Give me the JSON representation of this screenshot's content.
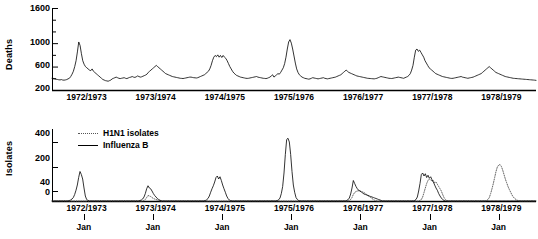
{
  "figure": {
    "panels": [
      {
        "id": "deaths",
        "ylabel": "Deaths",
        "yticks": [
          200,
          600,
          1000,
          1600
        ],
        "ymin": 200,
        "ymax": 1600
      },
      {
        "id": "isolates",
        "ylabel": "Isolates",
        "yticks": [
          0,
          40,
          200,
          400
        ],
        "ymin": 0,
        "ymax": 440
      }
    ],
    "seasons": [
      "1972/1973",
      "1973/1974",
      "1974/1975",
      "1975/1976",
      "1976/1977",
      "1977/1978",
      "1978/1979"
    ],
    "jan_label": "Jan",
    "legend": [
      {
        "label": "H1N1 isolates",
        "style": "dotted",
        "color": "#555555"
      },
      {
        "label": "Influenza B",
        "style": "solid",
        "color": "#000000"
      }
    ]
  },
  "chart_data": [
    {
      "type": "line",
      "id": "weekly-deaths",
      "title": "",
      "xlabel": "",
      "ylabel": "Deaths",
      "ylim": [
        200,
        1600
      ],
      "yticks": [
        200,
        600,
        1000,
        1600
      ],
      "grid": false,
      "legend_position": "none",
      "x_season_labels": [
        "1972/1973",
        "1973/1974",
        "1974/1975",
        "1975/1976",
        "1976/1977",
        "1977/1978",
        "1978/1979"
      ],
      "x_units": "weeks (7 seasons, 52 weeks each)",
      "series": [
        {
          "name": "Deaths",
          "color": "#000000",
          "values": [
            400,
            398,
            392,
            385,
            380,
            375,
            372,
            378,
            370,
            368,
            372,
            378,
            390,
            400,
            430,
            470,
            520,
            600,
            700,
            850,
            1020,
            960,
            820,
            700,
            640,
            600,
            580,
            560,
            540,
            530,
            560,
            520,
            500,
            480,
            460,
            440,
            420,
            400,
            380,
            370,
            360,
            355,
            350,
            360,
            370,
            390,
            400,
            410,
            420,
            410,
            400,
            395,
            400,
            405,
            410,
            400,
            395,
            405,
            415,
            420,
            430,
            420,
            415,
            425,
            440,
            430,
            420,
            425,
            435,
            445,
            455,
            470,
            500,
            520,
            540,
            560,
            580,
            600,
            620,
            600,
            580,
            560,
            540,
            520,
            500,
            480,
            470,
            460,
            450,
            440,
            430,
            425,
            420,
            415,
            410,
            405,
            400,
            398,
            396,
            400,
            405,
            410,
            415,
            420,
            420,
            415,
            410,
            408,
            405,
            410,
            420,
            430,
            440,
            450,
            460,
            480,
            500,
            520,
            560,
            620,
            700,
            760,
            790,
            770,
            800,
            760,
            790,
            755,
            790,
            760,
            740,
            700,
            650,
            600,
            560,
            520,
            490,
            470,
            450,
            440,
            430,
            420,
            415,
            410,
            405,
            400,
            398,
            400,
            405,
            410,
            415,
            420,
            425,
            430,
            420,
            415,
            410,
            405,
            400,
            398,
            395,
            400,
            410,
            420,
            440,
            460,
            420,
            440,
            460,
            480,
            470,
            500,
            540,
            580,
            650,
            760,
            900,
            1020,
            1060,
            1000,
            900,
            780,
            660,
            560,
            500,
            460,
            440,
            420,
            410,
            400,
            395,
            390,
            385,
            390,
            400,
            410,
            405,
            400,
            395,
            390,
            395,
            400,
            405,
            410,
            400,
            395,
            390,
            395,
            400,
            405,
            410,
            415,
            420,
            430,
            440,
            450,
            460,
            480,
            500,
            520,
            540,
            520,
            500,
            490,
            480,
            470,
            460,
            450,
            440,
            435,
            430,
            425,
            420,
            415,
            410,
            405,
            400,
            398,
            396,
            394,
            392,
            390,
            395,
            400,
            410,
            420,
            430,
            425,
            420,
            415,
            410,
            405,
            400,
            398,
            396,
            400,
            405,
            410,
            415,
            420,
            415,
            410,
            405,
            400,
            410,
            420,
            430,
            450,
            480,
            540,
            620,
            760,
            880,
            900,
            860,
            880,
            840,
            800,
            760,
            700,
            660,
            620,
            580,
            560,
            540,
            520,
            500,
            480,
            470,
            460,
            450,
            440,
            430,
            425,
            420,
            415,
            410,
            405,
            400,
            398,
            400,
            405,
            410,
            415,
            420,
            425,
            430,
            420,
            415,
            410,
            405,
            400,
            405,
            410,
            415,
            420,
            430,
            440,
            450,
            460,
            470,
            480,
            500,
            520,
            540,
            560,
            580,
            600,
            580,
            560,
            540,
            520,
            500,
            490,
            480,
            470,
            460,
            450,
            440,
            430,
            425,
            420,
            415,
            410,
            405,
            400,
            398,
            396,
            394,
            392,
            390,
            388,
            386,
            384,
            382,
            380,
            378,
            376,
            374,
            372,
            370,
            368,
            365
          ]
        }
      ]
    },
    {
      "type": "line",
      "id": "virus-isolates",
      "title": "",
      "xlabel": "",
      "ylabel": "Isolates",
      "ylim": [
        0,
        440
      ],
      "yticks": [
        0,
        40,
        200,
        400
      ],
      "grid": false,
      "legend_position": "top-left",
      "x_season_labels": [
        "1972/1973",
        "1973/1974",
        "1974/1975",
        "1975/1976",
        "1976/1977",
        "1977/1978",
        "1978/1979"
      ],
      "x_units": "weeks (7 seasons, 52 weeks each)",
      "series": [
        {
          "name": "Influenza B",
          "color": "#000000",
          "style": "solid",
          "values": [
            0,
            0,
            0,
            0,
            0,
            0,
            0,
            0,
            0,
            0,
            0,
            0,
            0,
            2,
            4,
            8,
            14,
            26,
            45,
            80,
            130,
            170,
            150,
            120,
            60,
            20,
            6,
            2,
            0,
            0,
            0,
            0,
            0,
            0,
            0,
            0,
            0,
            0,
            0,
            0,
            0,
            0,
            0,
            0,
            0,
            0,
            0,
            0,
            0,
            0,
            0,
            0,
            0,
            0,
            0,
            0,
            0,
            0,
            0,
            0,
            0,
            0,
            0,
            0,
            0,
            0,
            2,
            4,
            8,
            16,
            30,
            55,
            75,
            60,
            55,
            40,
            30,
            22,
            16,
            10,
            6,
            3,
            1,
            0,
            0,
            0,
            0,
            0,
            0,
            0,
            0,
            0,
            0,
            0,
            0,
            0,
            0,
            0,
            0,
            0,
            0,
            0,
            0,
            0,
            0,
            0,
            0,
            0,
            0,
            0,
            0,
            0,
            0,
            0,
            0,
            2,
            5,
            10,
            20,
            35,
            55,
            75,
            100,
            130,
            140,
            120,
            135,
            110,
            80,
            55,
            35,
            20,
            10,
            4,
            1,
            0,
            0,
            0,
            0,
            0,
            0,
            0,
            0,
            0,
            0,
            0,
            0,
            0,
            0,
            0,
            0,
            0,
            0,
            0,
            0,
            0,
            0,
            0,
            0,
            0,
            0,
            0,
            0,
            0,
            0,
            0,
            0,
            0,
            0,
            2,
            5,
            12,
            30,
            70,
            160,
            300,
            420,
            430,
            400,
            300,
            170,
            80,
            35,
            14,
            6,
            2,
            0,
            0,
            0,
            0,
            0,
            0,
            0,
            0,
            0,
            0,
            0,
            0,
            0,
            0,
            0,
            0,
            0,
            0,
            0,
            0,
            0,
            0,
            0,
            0,
            0,
            0,
            0,
            0,
            0,
            0,
            0,
            0,
            0,
            0,
            0,
            2,
            5,
            12,
            28,
            60,
            110,
            90,
            70,
            55,
            45,
            40,
            36,
            32,
            28,
            26,
            24,
            22,
            20,
            18,
            16,
            14,
            12,
            10,
            8,
            6,
            4,
            2,
            0,
            0,
            0,
            0,
            0,
            0,
            0,
            0,
            0,
            0,
            0,
            0,
            0,
            0,
            0,
            0,
            0,
            0,
            0,
            0,
            0,
            0,
            0,
            0,
            2,
            6,
            16,
            40,
            90,
            150,
            160,
            140,
            155,
            130,
            145,
            125,
            135,
            115,
            100,
            80,
            60,
            45,
            30,
            20,
            12,
            6,
            2,
            0,
            0,
            0,
            0,
            0,
            0,
            0,
            0,
            0,
            0,
            0,
            0,
            0,
            0,
            0,
            0,
            0,
            0,
            0,
            0,
            0,
            0,
            0,
            0,
            0,
            0,
            0,
            0,
            0,
            0,
            0,
            0,
            0,
            0,
            0,
            0,
            0,
            0,
            0,
            0,
            0,
            0,
            0,
            0,
            0,
            0,
            0,
            0,
            0,
            0,
            0,
            0,
            0,
            0,
            0,
            0,
            0,
            0,
            0,
            0,
            0,
            0,
            0,
            0,
            0,
            0,
            0,
            0,
            0
          ]
        },
        {
          "name": "H1N1 isolates",
          "color": "#555555",
          "style": "dotted",
          "values": [
            0,
            0,
            0,
            0,
            0,
            0,
            0,
            0,
            0,
            0,
            0,
            0,
            0,
            0,
            0,
            0,
            0,
            0,
            0,
            0,
            0,
            0,
            0,
            0,
            0,
            0,
            0,
            0,
            0,
            0,
            0,
            0,
            0,
            0,
            0,
            0,
            0,
            0,
            0,
            0,
            0,
            0,
            0,
            0,
            0,
            0,
            0,
            0,
            0,
            0,
            0,
            0,
            0,
            0,
            0,
            0,
            0,
            0,
            0,
            0,
            0,
            0,
            0,
            0,
            0,
            0,
            0,
            0,
            0,
            2,
            6,
            14,
            22,
            20,
            18,
            14,
            10,
            8,
            6,
            4,
            2,
            1,
            0,
            0,
            0,
            0,
            0,
            0,
            0,
            0,
            0,
            0,
            0,
            0,
            0,
            0,
            0,
            0,
            0,
            0,
            0,
            0,
            0,
            0,
            0,
            0,
            0,
            0,
            0,
            0,
            0,
            0,
            0,
            0,
            0,
            0,
            0,
            0,
            0,
            0,
            0,
            0,
            0,
            0,
            0,
            0,
            0,
            0,
            0,
            0,
            0,
            0,
            0,
            0,
            0,
            0,
            0,
            0,
            0,
            0,
            0,
            0,
            0,
            0,
            0,
            0,
            0,
            0,
            0,
            0,
            0,
            0,
            0,
            0,
            0,
            0,
            0,
            0,
            0,
            0,
            0,
            0,
            0,
            0,
            0,
            0,
            0,
            0,
            0,
            0,
            0,
            0,
            0,
            0,
            0,
            0,
            0,
            0,
            0,
            0,
            0,
            0,
            0,
            0,
            0,
            0,
            0,
            0,
            0,
            0,
            0,
            0,
            0,
            0,
            0,
            0,
            0,
            0,
            0,
            0,
            0,
            0,
            0,
            0,
            0,
            0,
            0,
            0,
            0,
            0,
            0,
            0,
            0,
            0,
            0,
            0,
            0,
            0,
            0,
            0,
            0,
            0,
            0,
            2,
            6,
            14,
            26,
            34,
            38,
            40,
            42,
            40,
            38,
            36,
            34,
            30,
            26,
            22,
            18,
            14,
            10,
            6,
            3,
            1,
            0,
            0,
            0,
            0,
            0,
            0,
            0,
            0,
            0,
            0,
            0,
            0,
            0,
            0,
            0,
            0,
            0,
            0,
            0,
            0,
            0,
            0,
            0,
            0,
            0,
            0,
            0,
            0,
            0,
            0,
            0,
            0,
            2,
            6,
            16,
            34,
            60,
            90,
            110,
            120,
            115,
            105,
            110,
            95,
            100,
            85,
            70,
            55,
            40,
            26,
            14,
            6,
            2,
            0,
            0,
            0,
            0,
            0,
            0,
            0,
            0,
            0,
            0,
            0,
            0,
            0,
            0,
            0,
            0,
            0,
            0,
            0,
            0,
            0,
            0,
            0,
            0,
            0,
            0,
            0,
            0,
            0,
            2,
            6,
            14,
            30,
            55,
            90,
            130,
            170,
            200,
            215,
            220,
            205,
            180,
            150,
            120,
            95,
            70,
            50,
            35,
            24,
            16,
            10,
            6,
            3,
            1,
            0,
            0,
            0,
            0,
            0,
            0,
            0,
            0,
            0,
            0,
            0,
            0,
            0
          ]
        }
      ]
    }
  ]
}
